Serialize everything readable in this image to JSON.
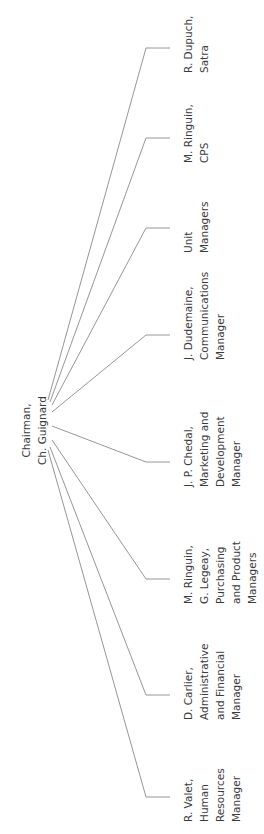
{
  "diagram": {
    "type": "org-chart",
    "orientation": "rotated-90-ccw",
    "line_color": "#8a8a8a",
    "text_color": "#3b3b3b",
    "root": {
      "lines": [
        "Chairman,",
        "Ch. Guignard"
      ],
      "anchor": {
        "x": 50,
        "y": 430
      }
    },
    "children": [
      {
        "lines": [
          "R. Dupuch,",
          "Satra"
        ],
        "tick_y": 48,
        "origin": {
          "x": 48,
          "y": 400
        }
      },
      {
        "lines": [
          "M. Ringuin,",
          "CPS"
        ],
        "tick_y": 138,
        "origin": {
          "x": 50,
          "y": 402
        }
      },
      {
        "lines": [
          "Unit",
          "Managers"
        ],
        "tick_y": 228,
        "origin": {
          "x": 52,
          "y": 405
        }
      },
      {
        "lines": [
          "J. Dudemaine,",
          "Communications",
          "Manager"
        ],
        "tick_y": 335,
        "origin": {
          "x": 52,
          "y": 412
        }
      },
      {
        "lines": [
          "J. P. Chedal,",
          "Marketing and",
          "Development",
          "Manager"
        ],
        "tick_y": 462,
        "origin": {
          "x": 52,
          "y": 426
        }
      },
      {
        "lines": [
          "M. Ringuin,",
          "G. Legeay,",
          "Purchasing",
          "and Product",
          "Managers"
        ],
        "tick_y": 579,
        "origin": {
          "x": 52,
          "y": 440
        }
      },
      {
        "lines": [
          "D. Carlier,",
          "Administrative",
          "and Financial",
          "Manager"
        ],
        "tick_y": 695,
        "origin": {
          "x": 50,
          "y": 447
        }
      },
      {
        "lines": [
          "R. Valet,",
          "Human",
          "Resources",
          "Manager"
        ],
        "tick_y": 797,
        "origin": {
          "x": 48,
          "y": 450
        }
      }
    ]
  }
}
